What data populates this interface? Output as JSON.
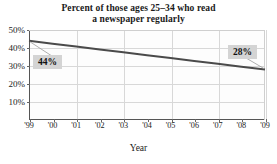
{
  "chart_data": {
    "type": "line",
    "title": "Percent of those ages 25–34 who read",
    "title_line2": "a newspaper regularly",
    "xlabel": "Year",
    "ylabel": "",
    "x": [
      "'99",
      "'00",
      "'01",
      "'02",
      "'03",
      "'04",
      "'05",
      "'06",
      "'07",
      "'08",
      "'09"
    ],
    "categories": [
      "'99",
      "'00",
      "'01",
      "'02",
      "'03",
      "'04",
      "'05",
      "'06",
      "'07",
      "'08",
      "'09"
    ],
    "values": [
      44,
      42.4,
      40.8,
      39.2,
      37.6,
      36,
      34.4,
      32.8,
      31.2,
      29.6,
      28
    ],
    "series": [
      {
        "name": "Percent reading a newspaper regularly",
        "values": [
          44,
          42.4,
          40.8,
          39.2,
          37.6,
          36,
          34.4,
          32.8,
          31.2,
          29.6,
          28
        ]
      }
    ],
    "xlim": [
      1999,
      2009
    ],
    "ylim": [
      0,
      50
    ],
    "ytick_values": [
      10,
      20,
      30,
      40,
      50
    ],
    "ytick_labels": [
      "10%",
      "20%",
      "30%",
      "40%",
      "50%"
    ],
    "xtick_labels": [
      "'99",
      "'00",
      "'01",
      "'02",
      "'03",
      "'04",
      "'05",
      "'06",
      "'07",
      "'08",
      "'09"
    ],
    "gridlines": {
      "horizontal": true,
      "vertical": true,
      "vertical_every_years": 2
    },
    "legend": null,
    "annotations": [
      {
        "name": "start-value-callout",
        "label": "44%",
        "x": "'99",
        "value": 44
      },
      {
        "name": "end-value-callout",
        "label": "28%",
        "x": "'09",
        "value": 28
      }
    ],
    "colors": {
      "line": "#4a4a4a",
      "grid": "#d8d8d8",
      "axis": "#555555",
      "callout_bg": "#d4d4d4",
      "text": "#1a1a1a",
      "plot_bg": "#fdfdfd"
    }
  }
}
